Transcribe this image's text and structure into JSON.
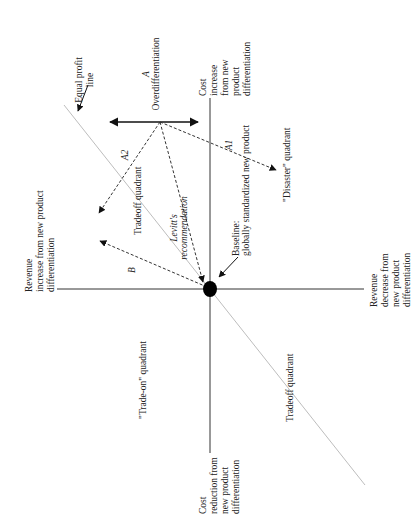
{
  "diagram": {
    "colors": {
      "axis": "#333333",
      "equal_profit_line": "#bdbdbd",
      "arrow": "#111111",
      "text": "#222222",
      "background": "#ffffff"
    },
    "axes": {
      "top": [
        "Cost",
        "increase",
        "from new",
        "product",
        "differentiation"
      ],
      "bottom": [
        "Cost",
        "reduction from",
        "new product",
        "differentiation"
      ],
      "left": [
        "Revenue",
        "increase from new product",
        "differentiation"
      ],
      "right": [
        "Revenue",
        "decrease from",
        "new product",
        "differentiation"
      ]
    },
    "equal_profit_line": [
      "Equal profit",
      "line"
    ],
    "point_a": [
      "A",
      "Overdifferentiation"
    ],
    "arrows": {
      "a1": "A1",
      "a2": "A2",
      "b": "B",
      "levitt": [
        "Levitt's",
        "recommendation"
      ]
    },
    "baseline": [
      "Baseline:",
      "globally standardized new product"
    ],
    "quadrants": {
      "tradeoff_upper": "Tradeoff quadrant",
      "disaster": "\"Disaster\" quadrant",
      "trade_on": "\"Trade-on\" quadrant",
      "tradeoff_lower": "Tradeoff quadrant"
    }
  }
}
